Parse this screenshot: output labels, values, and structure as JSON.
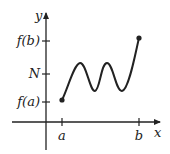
{
  "diagram": {
    "axes": {
      "x_label": "x",
      "y_label": "y"
    },
    "x_ticks": [
      {
        "id": "a",
        "label": "a"
      },
      {
        "id": "b",
        "label": "b"
      }
    ],
    "y_ticks": [
      {
        "id": "fb",
        "label": "f(b)"
      },
      {
        "id": "N",
        "label": "N"
      },
      {
        "id": "fa",
        "label": "f(a)"
      }
    ],
    "curve": {
      "description": "continuous curve from (a, f(a)) to (b, f(b)) oscillating twice across level N",
      "endpoints": [
        "(a, f(a))",
        "(b, f(b))"
      ],
      "color": "#222222"
    }
  }
}
